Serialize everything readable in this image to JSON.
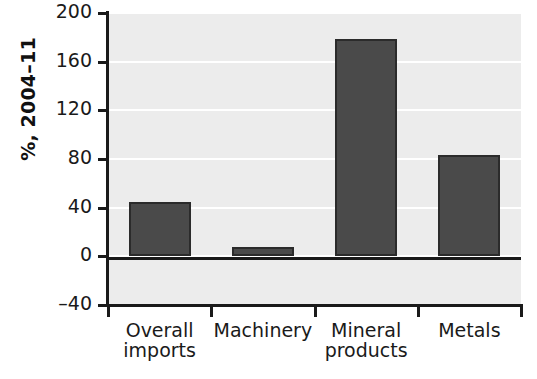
{
  "chart_data": {
    "type": "bar",
    "title": "",
    "xlabel": "",
    "ylabel": "%, 2004–11",
    "categories": [
      "Overall imports",
      "Machinery",
      "Mineral products",
      "Metals"
    ],
    "category_lines": [
      [
        "Overall",
        "imports"
      ],
      [
        "Machinery",
        ""
      ],
      [
        "Mineral",
        "products"
      ],
      [
        "Metals",
        ""
      ]
    ],
    "values": [
      45,
      8,
      179,
      83
    ],
    "ylim": [
      -40,
      200
    ],
    "yticks": [
      -40,
      0,
      40,
      80,
      120,
      160,
      200
    ],
    "ytick_labels": [
      "–40",
      "0",
      "40",
      "80",
      "120",
      "160",
      "200"
    ],
    "grid": true,
    "legend": "none",
    "colors": {
      "bar_fill": "#4a4a4a",
      "bar_edge": "#2b2b2b",
      "plot_background": "#ececec",
      "grid": "#ffffff",
      "axis": "#1a1a1a",
      "page_background": "#ffffff"
    }
  }
}
